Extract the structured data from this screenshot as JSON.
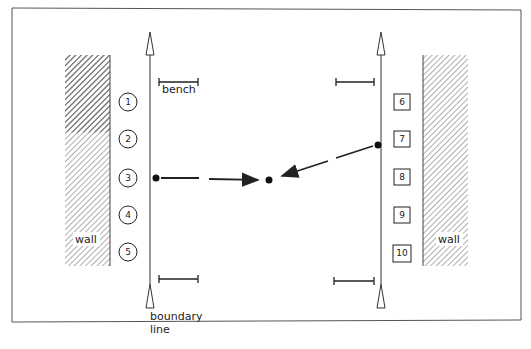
{
  "diagram": {
    "labels": {
      "bench": "bench",
      "wall_left": "wall",
      "wall_right": "wall",
      "boundary": [
        "boundary",
        "line"
      ]
    },
    "left_players": [
      "1",
      "2",
      "3",
      "4",
      "5"
    ],
    "right_players": [
      "6",
      "7",
      "8",
      "9",
      "10"
    ],
    "colors": {
      "line": "#222222",
      "frame": "#555555",
      "hatch": "#777777"
    }
  }
}
